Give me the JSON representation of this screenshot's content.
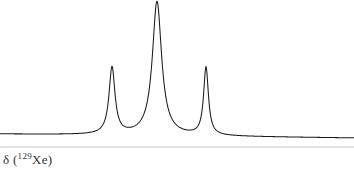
{
  "figure": {
    "background_color": "#ffffff",
    "trace_color": "#1a1a1a",
    "axis_line_color": "#c8c8c8",
    "label_color": "#333333",
    "width": 354,
    "height": 169
  },
  "axis": {
    "label_delta": "δ (",
    "label_mass": "129",
    "label_element": "Xe)",
    "label_full": "δ (129Xe)",
    "line_y": 147
  },
  "chart_data": {
    "type": "line",
    "title": "",
    "subtitle": "",
    "xlabel": "δ (129Xe)",
    "ylabel": "",
    "grid": false,
    "legend": null,
    "axis_direction": "reversed",
    "xlim": [
      0,
      354
    ],
    "ylim": [
      0,
      140
    ],
    "baseline": {
      "left_y": 134,
      "right_y": 138,
      "description": "slightly sloping baseline drifting downward left to right"
    },
    "peaks": [
      {
        "name": "peak-1",
        "center_x": 112,
        "apex_y": 68,
        "height": 67,
        "hwhm": 3.6,
        "relative_intensity": 0.49,
        "shape": "lorentzian"
      },
      {
        "name": "peak-2",
        "center_x": 157,
        "apex_y": 2,
        "height": 134,
        "hwhm": 5.6,
        "relative_intensity": 1.0,
        "shape": "lorentzian"
      },
      {
        "name": "peak-3",
        "center_x": 206,
        "apex_y": 67,
        "height": 68,
        "hwhm": 2.9,
        "relative_intensity": 0.5,
        "shape": "lorentzian"
      }
    ],
    "series": [
      {
        "name": "129Xe NMR signal",
        "x": [
          0,
          112,
          157,
          206,
          354
        ],
        "values": [
          0,
          67,
          134,
          68,
          0
        ]
      }
    ]
  }
}
